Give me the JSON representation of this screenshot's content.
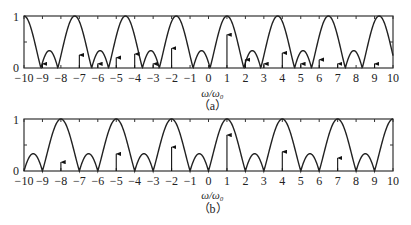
{
  "chart_data": [
    {
      "type": "line",
      "panel_label": "(a)",
      "xlabel": "ω/ω₀",
      "ylabel": "",
      "xlim": [
        -10,
        10
      ],
      "ylim": [
        0,
        1
      ],
      "x_ticks": [
        -10,
        -9,
        -8,
        -7,
        -6,
        -5,
        -4,
        -3,
        -2,
        -1,
        0,
        1,
        2,
        3,
        4,
        5,
        6,
        7,
        8,
        9,
        10
      ],
      "y_ticks": [
        0,
        1
      ],
      "y_tick_labels": [
        "0",
        "1"
      ],
      "grid": false,
      "envelope": {
        "name": "spectrum envelope",
        "period": 2.75,
        "peak_center": 1,
        "lobes": 3,
        "peaks_at": [
          -10,
          -7.25,
          -4.5,
          -1.75,
          1,
          3.75,
          6.5,
          9.25
        ]
      },
      "series": [
        {
          "name": "spectral lines",
          "type": "stem",
          "x": [
            -9,
            -7,
            -6,
            -5,
            -4,
            -3,
            -2,
            1,
            2,
            3,
            4,
            5,
            6,
            7,
            9
          ],
          "values": [
            0.08,
            0.25,
            0.08,
            0.2,
            0.27,
            0.08,
            0.38,
            0.64,
            0.16,
            0.08,
            0.29,
            0.08,
            0.16,
            0.08,
            0.08
          ]
        }
      ]
    },
    {
      "type": "line",
      "panel_label": "(b)",
      "xlabel": "ω/ω₀",
      "ylabel": "",
      "xlim": [
        -10,
        10
      ],
      "ylim": [
        0,
        1
      ],
      "x_ticks": [
        -10,
        -9,
        -8,
        -7,
        -6,
        -5,
        -4,
        -3,
        -2,
        -1,
        0,
        1,
        2,
        3,
        4,
        5,
        6,
        7,
        8,
        9,
        10
      ],
      "y_ticks": [
        0,
        1
      ],
      "y_tick_labels": [
        "0",
        "1"
      ],
      "grid": false,
      "envelope": {
        "name": "spectrum envelope",
        "period": 3,
        "peak_center": 1,
        "lobes": 3,
        "peaks_at": [
          -8,
          -5,
          -2,
          1,
          4,
          7,
          10
        ]
      },
      "series": [
        {
          "name": "spectral lines",
          "type": "stem",
          "x": [
            -8,
            -5,
            -2,
            1,
            4,
            7
          ],
          "values": [
            0.17,
            0.33,
            0.46,
            0.69,
            0.37,
            0.25
          ]
        }
      ]
    }
  ],
  "panels": [
    {
      "caption": "（a）",
      "xlabel": "ω/ω₀",
      "y_top": "1",
      "y_bottom": "0"
    },
    {
      "caption": "（b）",
      "xlabel": "ω/ω₀",
      "y_top": "1",
      "y_bottom": "0"
    }
  ]
}
